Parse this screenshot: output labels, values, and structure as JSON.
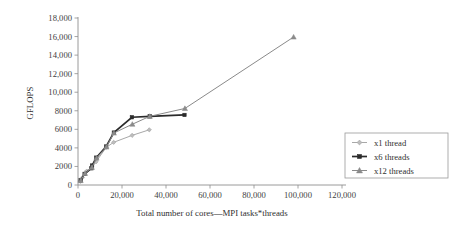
{
  "chart_data": {
    "type": "line",
    "title": "",
    "xlabel": "Total number of cores—MPI tasks*threads",
    "ylabel": "GFLOPS",
    "xlim": [
      0,
      120000
    ],
    "ylim": [
      0,
      18000
    ],
    "grid": false,
    "legend_position": "right-lower",
    "xticks": [
      0,
      20000,
      40000,
      60000,
      80000,
      100000,
      120000
    ],
    "xtick_labels": [
      "0",
      "20,000",
      "40,000",
      "60,000",
      "80,000",
      "100,000",
      "120,000"
    ],
    "yticks": [
      0,
      2000,
      4000,
      6000,
      8000,
      10000,
      12000,
      14000,
      16000,
      18000
    ],
    "ytick_labels": [
      "0",
      "2000",
      "4000",
      "6000",
      "8000",
      "10,000",
      "12,000",
      "14,000",
      "16,000",
      "18,000"
    ],
    "series": [
      {
        "name": "x1 thread",
        "marker": "diamond",
        "color": "#a8a8a8",
        "points": [
          {
            "x": 1000,
            "y": 400
          },
          {
            "x": 2000,
            "y": 800
          },
          {
            "x": 4000,
            "y": 1500
          },
          {
            "x": 6200,
            "y": 1850
          },
          {
            "x": 8200,
            "y": 2500
          },
          {
            "x": 12800,
            "y": 4050
          },
          {
            "x": 16200,
            "y": 4600
          },
          {
            "x": 24600,
            "y": 5350
          },
          {
            "x": 32400,
            "y": 5950
          }
        ]
      },
      {
        "name": "x6 threads",
        "marker": "square",
        "color": "#2b2b2b",
        "points": [
          {
            "x": 1200,
            "y": 500
          },
          {
            "x": 3000,
            "y": 1200
          },
          {
            "x": 6100,
            "y": 1800
          },
          {
            "x": 6400,
            "y": 2100
          },
          {
            "x": 8300,
            "y": 2950
          },
          {
            "x": 12800,
            "y": 4150
          },
          {
            "x": 16300,
            "y": 5650
          },
          {
            "x": 24500,
            "y": 7300
          },
          {
            "x": 32600,
            "y": 7400
          },
          {
            "x": 48400,
            "y": 7550
          }
        ]
      },
      {
        "name": "x12 threads",
        "marker": "triangle",
        "color": "#8a8a8a",
        "points": [
          {
            "x": 1200,
            "y": 480
          },
          {
            "x": 3200,
            "y": 1250
          },
          {
            "x": 6300,
            "y": 1900
          },
          {
            "x": 8400,
            "y": 2900
          },
          {
            "x": 12900,
            "y": 4100
          },
          {
            "x": 16300,
            "y": 5600
          },
          {
            "x": 24700,
            "y": 6550
          },
          {
            "x": 32600,
            "y": 7400
          },
          {
            "x": 48600,
            "y": 8250
          },
          {
            "x": 98000,
            "y": 15950
          }
        ]
      }
    ]
  },
  "legend": {
    "items": [
      {
        "label": "x1 thread"
      },
      {
        "label": "x6 threads"
      },
      {
        "label": "x12 threads"
      }
    ]
  },
  "colors": {
    "axis": "#8e8e8e",
    "text": "#3a3a3a",
    "series_light": "#a8a8a8",
    "series_dark": "#2b2b2b",
    "series_mid": "#8a8a8a",
    "background": "#ffffff"
  }
}
